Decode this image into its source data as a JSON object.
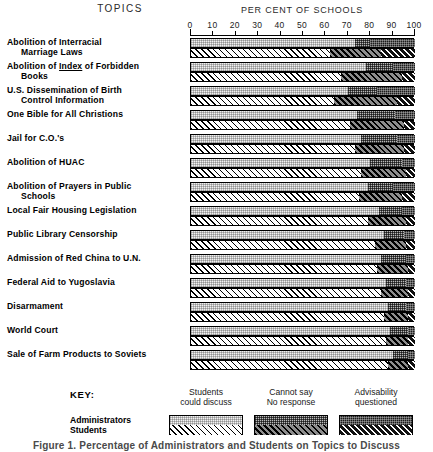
{
  "headers": {
    "topics": "TOPICS",
    "axis_title": "PER CENT OF SCHOOLS"
  },
  "key": {
    "title": "KEY:",
    "columns": [
      {
        "line1": "Students",
        "line2": "could discuss"
      },
      {
        "line1": "Cannot say",
        "line2": "No response"
      },
      {
        "line1": "Advisability",
        "line2": "questioned"
      }
    ],
    "series_labels": {
      "admin": "Administrators",
      "students": "Students"
    }
  },
  "caption": "Figure 1. Percentage of Administrators and Students on Topics to Discuss",
  "chart_data": {
    "type": "bar",
    "title": "PER CENT OF SCHOOLS",
    "xlabel": "PER CENT OF SCHOOLS",
    "ylabel": "TOPICS",
    "xlim": [
      0,
      100
    ],
    "ticks": [
      0,
      10,
      20,
      30,
      40,
      50,
      60,
      70,
      80,
      90,
      100
    ],
    "grid": false,
    "stacked": true,
    "legend_position": "bottom",
    "segment_names": [
      "Students could discuss",
      "Cannot say / No response",
      "Advisability questioned"
    ],
    "series_names": [
      "Administrators",
      "Students"
    ],
    "categories": [
      "Abolition of Interracial Marriage Laws",
      "Abolition of Index of Forbidden Books",
      "U.S. Dissemination of Birth Control Information",
      "One Bible for All Christians",
      "Jail for C.O.'s",
      "Abolition of HUAC",
      "Abolition of Prayers in Public Schools",
      "Local Fair Housing Legislation",
      "Public Library Censorship",
      "Admission of Red China to U.N.",
      "Federal Aid to Yugoslavia",
      "Disarmament",
      "World Court",
      "Sale of Farm Products to Soviets"
    ],
    "rows": [
      {
        "label_line1": "Abolition of Interracial",
        "label_line2": "Marriage Laws",
        "underline": "",
        "admin": [
          73,
          7,
          20
        ],
        "students": [
          62,
          23,
          15
        ]
      },
      {
        "label_line1": "Abolition of Index of Forbidden",
        "label_line2": "Books",
        "underline": "Index",
        "admin": [
          78,
          12,
          10
        ],
        "students": [
          67,
          27,
          6
        ]
      },
      {
        "label_line1": "U.S. Dissemination of Birth",
        "label_line2": "Control Information",
        "underline": "",
        "admin": [
          70,
          13,
          17
        ],
        "students": [
          64,
          28,
          8
        ]
      },
      {
        "label_line1": "One Bible for All Christions",
        "label_line2": "",
        "underline": "",
        "admin": [
          74,
          17,
          9
        ],
        "students": [
          71,
          24,
          5
        ]
      },
      {
        "label_line1": "Jail for C.O.'s",
        "label_line2": "",
        "underline": "",
        "admin": [
          76,
          16,
          8
        ],
        "students": [
          73,
          22,
          5
        ]
      },
      {
        "label_line1": "Abolition of HUAC",
        "label_line2": "",
        "underline": "",
        "admin": [
          80,
          14,
          6
        ],
        "students": [
          76,
          20,
          4
        ]
      },
      {
        "label_line1": "Abolition of Prayers in Public",
        "label_line2": "Schools",
        "underline": "",
        "admin": [
          79,
          11,
          10
        ],
        "students": [
          75,
          19,
          6
        ]
      },
      {
        "label_line1": "Local Fair Housing Legislation",
        "label_line2": "",
        "underline": "",
        "admin": [
          84,
          10,
          6
        ],
        "students": [
          79,
          17,
          4
        ]
      },
      {
        "label_line1": "Public Library Censorship",
        "label_line2": "",
        "underline": "",
        "admin": [
          86,
          9,
          5
        ],
        "students": [
          82,
          14,
          4
        ]
      },
      {
        "label_line1": "Admission of Red China to U.N.",
        "label_line2": "",
        "underline": "",
        "admin": [
          85,
          11,
          4
        ],
        "students": [
          83,
          14,
          3
        ]
      },
      {
        "label_line1": "Federal Aid to Yugoslavia",
        "label_line2": "",
        "underline": "",
        "admin": [
          87,
          9,
          4
        ],
        "students": [
          85,
          12,
          3
        ]
      },
      {
        "label_line1": "Disarmament",
        "label_line2": "",
        "underline": "",
        "admin": [
          88,
          8,
          4
        ],
        "students": [
          86,
          11,
          3
        ]
      },
      {
        "label_line1": "World Court",
        "label_line2": "",
        "underline": "",
        "admin": [
          89,
          8,
          3
        ],
        "students": [
          87,
          10,
          3
        ]
      },
      {
        "label_line1": "Sale of Farm Products to Soviets",
        "label_line2": "",
        "underline": "",
        "admin": [
          90,
          7,
          3
        ],
        "students": [
          88,
          9,
          3
        ]
      }
    ]
  }
}
